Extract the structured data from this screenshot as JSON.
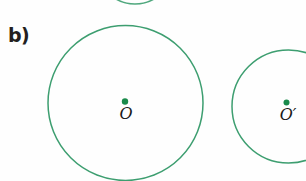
{
  "figure": {
    "panel_label": "b)",
    "background_color": "#fefefe",
    "width": 306,
    "height": 181,
    "stroke_color": "#3d9e70",
    "dot_color": "#1a8a4a",
    "label_color": "#1a1a1a",
    "panel_label_color": "#231f20"
  },
  "shapes": {
    "top_partial_arc": {
      "name": "top-partial-circle-arc",
      "cx": 135,
      "cy": -34,
      "r": 38,
      "stroke_width": 1.6
    },
    "large_circle": {
      "name": "large-circle",
      "cx": 125.5,
      "cy": 103,
      "r": 77.5,
      "stroke_width": 1.5,
      "center_dot": {
        "cx": 125,
        "cy": 101.5,
        "r": 3.2
      },
      "center_label": "O"
    },
    "small_circle": {
      "name": "small-circle",
      "cx": 288.5,
      "cy": 106.5,
      "r": 56.5,
      "stroke_width": 1.5,
      "center_dot": {
        "cx": 286.5,
        "cy": 102.5,
        "r": 3.0
      },
      "center_label": "O′"
    }
  }
}
